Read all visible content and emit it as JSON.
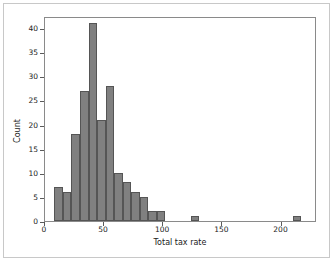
{
  "chart_data": {
    "type": "bar",
    "title": "",
    "subtitle": "",
    "xlabel": "Total tax rate",
    "ylabel": "Count",
    "xlim": [
      0,
      230
    ],
    "ylim": [
      0,
      42.5
    ],
    "grid": false,
    "legend": null,
    "bin_width": 7.2,
    "bar_color": "#808080",
    "bar_edge_color": "#555555",
    "xticks": [
      0,
      50,
      100,
      150,
      200
    ],
    "xtick_labels": [
      "0",
      "50",
      "100",
      "150",
      "200"
    ],
    "yticks": [
      0,
      5,
      10,
      15,
      20,
      25,
      30,
      35,
      40
    ],
    "ytick_labels": [
      "0",
      "5",
      "10",
      "15",
      "20",
      "25",
      "30",
      "35",
      "40"
    ],
    "bins": [
      {
        "x0": 8.0,
        "x1": 15.2,
        "count": 7
      },
      {
        "x0": 15.2,
        "x1": 22.4,
        "count": 6
      },
      {
        "x0": 22.4,
        "x1": 29.6,
        "count": 18
      },
      {
        "x0": 29.6,
        "x1": 36.8,
        "count": 27
      },
      {
        "x0": 36.8,
        "x1": 44.0,
        "count": 41
      },
      {
        "x0": 44.0,
        "x1": 51.2,
        "count": 21
      },
      {
        "x0": 51.2,
        "x1": 58.4,
        "count": 28
      },
      {
        "x0": 58.4,
        "x1": 65.6,
        "count": 10
      },
      {
        "x0": 65.6,
        "x1": 72.8,
        "count": 8
      },
      {
        "x0": 72.8,
        "x1": 80.0,
        "count": 6
      },
      {
        "x0": 80.0,
        "x1": 87.2,
        "count": 5
      },
      {
        "x0": 87.2,
        "x1": 94.4,
        "count": 2
      },
      {
        "x0": 94.4,
        "x1": 101.6,
        "count": 2
      },
      {
        "x0": 101.6,
        "x1": 108.8,
        "count": 0
      },
      {
        "x0": 108.8,
        "x1": 116.0,
        "count": 0
      },
      {
        "x0": 123.2,
        "x1": 130.4,
        "count": 1
      },
      {
        "x0": 209.6,
        "x1": 216.8,
        "count": 1
      }
    ],
    "categories": [
      "8.0-15.2",
      "15.2-22.4",
      "22.4-29.6",
      "29.6-36.8",
      "36.8-44.0",
      "44.0-51.2",
      "51.2-58.4",
      "58.4-65.6",
      "65.6-72.8",
      "72.8-80.0",
      "80.0-87.2",
      "87.2-94.4",
      "94.4-101.6",
      "123.2-130.4",
      "209.6-216.8"
    ],
    "values": [
      7,
      6,
      18,
      27,
      41,
      21,
      28,
      10,
      8,
      6,
      5,
      2,
      2,
      1,
      1
    ]
  }
}
